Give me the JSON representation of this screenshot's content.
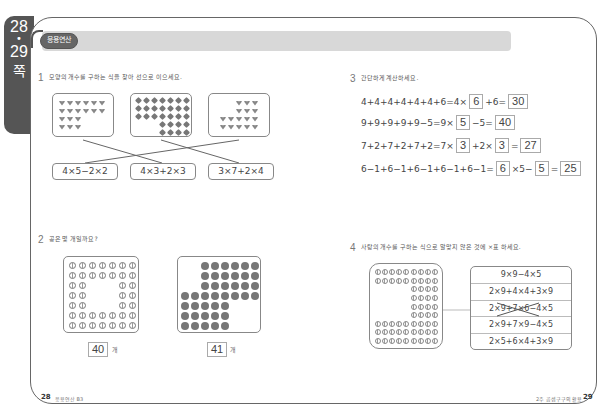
{
  "side_tab": {
    "page_start": "28",
    "dot": "•",
    "page_end": "29",
    "suffix": "쪽"
  },
  "header": {
    "badge": "응용연산"
  },
  "q1": {
    "number": "1",
    "instruction": "모양의 개수를 구하는 식을 찾아 선으로 이으세요.",
    "boxes": [
      {
        "shape": "heart",
        "rows": [
          [
            1,
            1,
            1,
            1,
            1,
            1
          ],
          [
            1,
            1,
            1,
            1,
            1,
            1
          ],
          [
            1,
            1,
            1,
            0,
            0,
            0
          ],
          [
            1,
            1,
            1,
            0,
            0,
            0
          ]
        ],
        "count": 18
      },
      {
        "shape": "diamond",
        "rows": [
          [
            1,
            1,
            1,
            1,
            1,
            1,
            1
          ],
          [
            1,
            1,
            1,
            1,
            1,
            1,
            1
          ],
          [
            1,
            1,
            1,
            1,
            1,
            1,
            1
          ],
          [
            0,
            0,
            0,
            1,
            1,
            1,
            1
          ],
          [
            0,
            0,
            0,
            1,
            1,
            1,
            1
          ]
        ],
        "count": 29
      },
      {
        "shape": "heart",
        "rows": [
          [
            0,
            0,
            1,
            1,
            1
          ],
          [
            0,
            0,
            1,
            1,
            1
          ],
          [
            1,
            1,
            1,
            1,
            1
          ],
          [
            1,
            1,
            1,
            1,
            1
          ]
        ],
        "count": 16
      }
    ],
    "formulas": [
      "4×5−2×2",
      "4×3+2×3",
      "3×7+2×4"
    ],
    "connections": [
      {
        "box": 1,
        "formula": 2
      },
      {
        "box": 2,
        "formula": 3
      },
      {
        "box": 3,
        "formula": 1
      }
    ]
  },
  "q2": {
    "number": "2",
    "instruction": "공은 몇 개일까요?",
    "unit": "개",
    "answers": [
      "40",
      "41"
    ],
    "grid1": [
      [
        1,
        1,
        1,
        1,
        1,
        1,
        1
      ],
      [
        1,
        1,
        1,
        1,
        1,
        1,
        1
      ],
      [
        1,
        1,
        0,
        0,
        0,
        1,
        1
      ],
      [
        1,
        1,
        0,
        0,
        0,
        1,
        1
      ],
      [
        1,
        1,
        0,
        0,
        0,
        1,
        1
      ],
      [
        1,
        1,
        1,
        1,
        1,
        1,
        1
      ],
      [
        1,
        1,
        1,
        1,
        1,
        1,
        1
      ]
    ],
    "grid2": [
      [
        0,
        0,
        1,
        1,
        1,
        1,
        1,
        1
      ],
      [
        0,
        0,
        1,
        1,
        1,
        1,
        1,
        1
      ],
      [
        0,
        0,
        1,
        1,
        1,
        1,
        1,
        1
      ],
      [
        1,
        1,
        1,
        1,
        1,
        1,
        1,
        1
      ],
      [
        1,
        1,
        1,
        1,
        1,
        0,
        0,
        0
      ],
      [
        1,
        1,
        1,
        1,
        1,
        0,
        0,
        0
      ],
      [
        1,
        1,
        1,
        1,
        1,
        0,
        0,
        0
      ]
    ]
  },
  "q3": {
    "number": "3",
    "instruction": "간단하게 계산하세요.",
    "equations": [
      {
        "parts": [
          "4+4+4+4+4+4+6=4×",
          "+6=",
          ""
        ],
        "answers": [
          "6",
          "30"
        ]
      },
      {
        "parts": [
          "9+9+9+9+9−5=9×",
          "−5=",
          ""
        ],
        "answers": [
          "5",
          "40"
        ]
      },
      {
        "parts": [
          "7+2+7+2+7+2=7×",
          "+2×",
          "=",
          ""
        ],
        "answers": [
          "3",
          "3",
          "27"
        ]
      },
      {
        "parts": [
          "6−1+6−1+6−1+6−1+6−1=",
          "×5−",
          "=",
          ""
        ],
        "answers": [
          "6",
          "5",
          "25"
        ]
      }
    ]
  },
  "q4": {
    "number": "4",
    "instruction": "사탕의 개수를 구하는 식으로 알맞지 않은 것에 ×표 하세요.",
    "grid": [
      [
        1,
        1,
        1,
        1,
        1,
        1,
        1,
        1,
        1
      ],
      [
        1,
        1,
        1,
        1,
        1,
        1,
        1,
        1,
        1
      ],
      [
        0,
        0,
        0,
        0,
        0,
        1,
        1,
        1,
        1
      ],
      [
        0,
        0,
        0,
        0,
        0,
        1,
        1,
        1,
        1
      ],
      [
        0,
        0,
        0,
        0,
        0,
        1,
        1,
        1,
        1
      ],
      [
        0,
        0,
        0,
        0,
        0,
        1,
        1,
        1,
        1
      ],
      [
        1,
        1,
        1,
        1,
        1,
        1,
        1,
        1,
        1
      ],
      [
        1,
        1,
        1,
        1,
        1,
        1,
        1,
        1,
        1
      ],
      [
        1,
        1,
        1,
        1,
        1,
        1,
        1,
        1,
        1
      ]
    ],
    "options": [
      "9×9−4×5",
      "2×9+4×4+3×9",
      "2×9+7×6−4×5",
      "2×9+7×9−4×5",
      "2×5+6×4+3×9"
    ],
    "crossed_index": 2
  },
  "footer": {
    "left_page": "28",
    "left_text": "응용연산 B3",
    "right_text": "2주 곱셈구구의 활용",
    "right_page": "29"
  }
}
